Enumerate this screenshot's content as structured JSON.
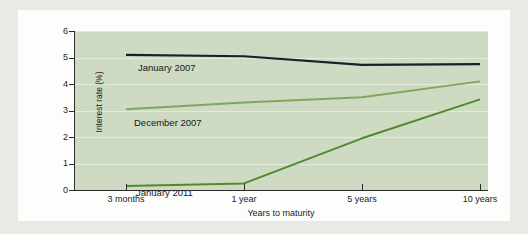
{
  "chart_data": {
    "type": "line",
    "title": "",
    "xlabel": "Years to maturity",
    "ylabel": "Interest rate (%)",
    "categories": [
      "3 months",
      "1 year",
      "5 years",
      "10 years"
    ],
    "x_positions": [
      0,
      1,
      2,
      3
    ],
    "ylim": [
      0,
      6
    ],
    "yticks": [
      0,
      1,
      2,
      3,
      4,
      5,
      6
    ],
    "ytick_labels": [
      "0",
      "1",
      "2",
      "3",
      "4",
      "5",
      "6"
    ],
    "grid": true,
    "legend_position": "inline-annotation",
    "series": [
      {
        "name": "January 2007",
        "color": "#1a1f2e",
        "values": [
          5.1,
          5.05,
          4.72,
          4.75
        ]
      },
      {
        "name": "December 2007",
        "color": "#7fa85f",
        "values": [
          3.05,
          3.3,
          3.5,
          4.1
        ]
      },
      {
        "name": "January 2011",
        "color": "#4f8a2f",
        "values": [
          0.15,
          0.25,
          1.95,
          3.42
        ]
      }
    ],
    "annotations": [
      {
        "text": "January 2007"
      },
      {
        "text": "December 2007"
      },
      {
        "text": "January 2011"
      }
    ]
  },
  "colors": {
    "page_background": "#e9eae5",
    "card_background": "#fdfdfc",
    "plot_background": "#cfdac2",
    "gridline": "#e4eade",
    "axis": "#2a2a2a",
    "text": "#1c1c1c"
  }
}
